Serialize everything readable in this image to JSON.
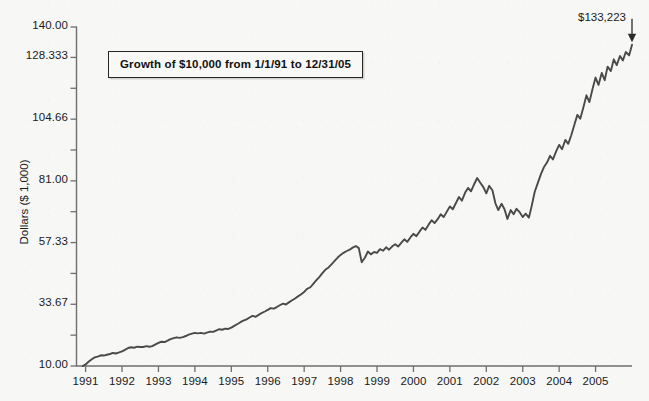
{
  "figure": {
    "background_color": "#f7f7f5",
    "line_color": "#4a4a4a",
    "axis_color": "#6f6f6f"
  },
  "annotations": {
    "callout_text": "Growth of $10,000 from 1/1/91 to 12/31/05",
    "endpoint_label": "$133,223",
    "arrow_icon": "down-arrow-icon"
  },
  "chart_data": {
    "type": "line",
    "title": "",
    "subtitle": "",
    "xlabel": "",
    "ylabel": "Dollars ($ 1,000)",
    "grid": false,
    "legend": null,
    "xlim": [
      1990.75,
      2006.0
    ],
    "ylim": [
      10.0,
      140.0
    ],
    "ytick_labels": [
      "140.00",
      "128.333",
      "",
      "104.66",
      "",
      "81.00",
      "",
      "57.33",
      "",
      "33.67",
      "",
      "10.00"
    ],
    "ytick_values": [
      140.0,
      128.333,
      116.5,
      104.66,
      92.83,
      81.0,
      69.17,
      57.33,
      45.5,
      33.67,
      21.83,
      10.0
    ],
    "xtick_labels": [
      "1991",
      "1992",
      "1993",
      "1994",
      "1995",
      "1996",
      "1997",
      "1998",
      "1999",
      "2000",
      "2001",
      "2002",
      "2003",
      "2004",
      "2005"
    ],
    "xtick_values": [
      1991,
      1992,
      1993,
      1994,
      1995,
      1996,
      1997,
      1998,
      1999,
      2000,
      2001,
      2002,
      2003,
      2004,
      2005
    ],
    "series": [
      {
        "name": "Growth of $10,000",
        "x": [
          1990.92,
          1991.0,
          1991.08,
          1991.17,
          1991.25,
          1991.33,
          1991.42,
          1991.5,
          1991.58,
          1991.67,
          1991.75,
          1991.83,
          1991.92,
          1992.0,
          1992.08,
          1992.17,
          1992.25,
          1992.33,
          1992.42,
          1992.5,
          1992.58,
          1992.67,
          1992.75,
          1992.83,
          1992.92,
          1993.0,
          1993.08,
          1993.17,
          1993.25,
          1993.33,
          1993.42,
          1993.5,
          1993.58,
          1993.67,
          1993.75,
          1993.83,
          1993.92,
          1994.0,
          1994.08,
          1994.17,
          1994.25,
          1994.33,
          1994.42,
          1994.5,
          1994.58,
          1994.67,
          1994.75,
          1994.83,
          1994.92,
          1995.0,
          1995.08,
          1995.17,
          1995.25,
          1995.33,
          1995.42,
          1995.5,
          1995.58,
          1995.67,
          1995.75,
          1995.83,
          1995.92,
          1996.0,
          1996.08,
          1996.17,
          1996.25,
          1996.33,
          1996.42,
          1996.5,
          1996.58,
          1996.67,
          1996.75,
          1996.83,
          1996.92,
          1997.0,
          1997.08,
          1997.17,
          1997.25,
          1997.33,
          1997.42,
          1997.5,
          1997.58,
          1997.67,
          1997.75,
          1997.83,
          1997.92,
          1998.0,
          1998.08,
          1998.17,
          1998.25,
          1998.33,
          1998.42,
          1998.5,
          1998.58,
          1998.67,
          1998.75,
          1998.83,
          1998.92,
          1999.0,
          1999.08,
          1999.17,
          1999.25,
          1999.33,
          1999.42,
          1999.5,
          1999.58,
          1999.67,
          1999.75,
          1999.83,
          1999.92,
          2000.0,
          2000.08,
          2000.17,
          2000.25,
          2000.33,
          2000.42,
          2000.5,
          2000.58,
          2000.67,
          2000.75,
          2000.83,
          2000.92,
          2001.0,
          2001.08,
          2001.17,
          2001.25,
          2001.33,
          2001.42,
          2001.5,
          2001.58,
          2001.67,
          2001.75,
          2001.83,
          2001.92,
          2002.0,
          2002.08,
          2002.17,
          2002.25,
          2002.33,
          2002.42,
          2002.5,
          2002.58,
          2002.67,
          2002.75,
          2002.83,
          2002.92,
          2003.0,
          2003.08,
          2003.17,
          2003.25,
          2003.33,
          2003.42,
          2003.5,
          2003.58,
          2003.67,
          2003.75,
          2003.83,
          2003.92,
          2004.0,
          2004.08,
          2004.17,
          2004.25,
          2004.33,
          2004.42,
          2004.5,
          2004.58,
          2004.67,
          2004.75,
          2004.83,
          2004.92,
          2005.0,
          2005.08,
          2005.17,
          2005.25,
          2005.33,
          2005.42,
          2005.5,
          2005.58,
          2005.67,
          2005.75,
          2005.83,
          2005.92,
          2006.0
        ],
        "y": [
          10.0,
          10.6,
          11.6,
          12.6,
          13.3,
          13.6,
          14.1,
          14.0,
          14.3,
          14.6,
          15.0,
          14.8,
          15.2,
          15.6,
          16.2,
          16.9,
          17.2,
          17.0,
          17.4,
          17.3,
          17.3,
          17.6,
          17.4,
          17.6,
          18.3,
          18.9,
          19.3,
          19.2,
          19.7,
          20.3,
          20.7,
          21.0,
          20.8,
          21.1,
          21.5,
          22.0,
          22.4,
          22.7,
          22.5,
          22.7,
          22.4,
          22.8,
          23.2,
          23.1,
          23.6,
          24.1,
          23.9,
          24.3,
          24.2,
          24.7,
          25.4,
          26.1,
          26.8,
          27.4,
          27.9,
          28.6,
          29.2,
          28.9,
          29.6,
          30.3,
          30.9,
          31.5,
          32.2,
          32.0,
          32.6,
          33.3,
          33.9,
          33.6,
          34.4,
          35.2,
          35.9,
          36.7,
          37.5,
          38.4,
          39.6,
          40.2,
          41.5,
          42.8,
          44.2,
          45.6,
          46.9,
          47.8,
          49.0,
          50.2,
          51.6,
          52.6,
          53.4,
          54.1,
          54.6,
          55.4,
          56.0,
          55.2,
          49.8,
          51.6,
          53.9,
          52.8,
          53.7,
          53.4,
          54.8,
          54.2,
          55.5,
          54.6,
          55.9,
          56.7,
          55.8,
          57.3,
          58.6,
          57.6,
          59.4,
          60.7,
          59.8,
          61.6,
          63.1,
          62.2,
          64.3,
          65.9,
          64.8,
          66.4,
          68.2,
          67.1,
          69.3,
          71.2,
          70.1,
          72.6,
          74.8,
          73.4,
          76.5,
          78.3,
          77.0,
          79.8,
          82.1,
          80.4,
          78.6,
          76.2,
          79.1,
          77.3,
          72.4,
          69.8,
          72.2,
          70.1,
          66.4,
          69.8,
          68.2,
          70.3,
          68.9,
          67.1,
          68.4,
          66.9,
          71.6,
          76.8,
          80.4,
          83.6,
          86.2,
          88.1,
          90.6,
          89.2,
          92.4,
          94.8,
          93.1,
          96.7,
          95.2,
          98.4,
          102.6,
          106.3,
          104.8,
          109.4,
          113.8,
          111.2,
          116.4,
          120.6,
          117.8,
          122.4,
          119.6,
          124.8,
          123.1,
          127.6,
          125.4,
          128.9,
          127.2,
          130.4,
          129.1,
          133.223
        ]
      }
    ],
    "final_value": 133.223,
    "initial_value": 10.0
  }
}
